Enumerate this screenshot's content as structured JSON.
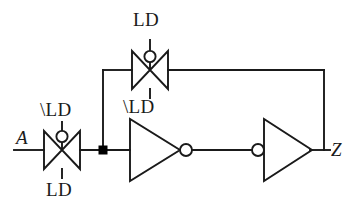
{
  "diagram": {
    "type": "schematic",
    "background_color": "#ffffff",
    "line_color": "#1a1a1a",
    "junction_color": "#000000",
    "ports": {
      "input": {
        "name": "A",
        "label": "A",
        "x": 22,
        "y": 137
      },
      "output": {
        "name": "Z",
        "label": "Z",
        "x": 331,
        "y": 158
      }
    },
    "components": [
      {
        "id": "tg-input",
        "kind": "transmission-gate",
        "name": "input-transmission-gate",
        "cx": 62,
        "cy": 150,
        "top_label": "\\LD",
        "bottom_label": "LD",
        "bubble_position": "top"
      },
      {
        "id": "tg-feedback",
        "kind": "transmission-gate",
        "name": "feedback-transmission-gate",
        "cx": 150,
        "cy": 70,
        "top_label": "LD",
        "bottom_label": "\\LD",
        "bubble_position": "top"
      },
      {
        "id": "inv-1",
        "kind": "inverter",
        "name": "first-inverter",
        "direction": "right",
        "bubble_side": "output",
        "x1": 130,
        "x2": 186,
        "cy": 150
      },
      {
        "id": "inv-2",
        "kind": "inverter",
        "name": "second-inverter",
        "direction": "right",
        "bubble_side": "input",
        "x1": 258,
        "x2": 310,
        "cy": 150
      }
    ],
    "labels": [
      {
        "id": "tg-input-top",
        "text": "\\LD",
        "x": 40,
        "y": 100,
        "style": "signal"
      },
      {
        "id": "tg-input-bottom",
        "text": "LD",
        "x": 46,
        "y": 180,
        "style": "signal"
      },
      {
        "id": "tg-feedback-top",
        "text": "LD",
        "x": 133,
        "y": 10,
        "style": "signal"
      },
      {
        "id": "tg-feedback-bottom",
        "text": "\\LD",
        "x": 123,
        "y": 97,
        "style": "signal"
      },
      {
        "id": "port-a",
        "text": "A",
        "x": 16,
        "y": 128,
        "style": "port"
      },
      {
        "id": "port-z",
        "text": "Z",
        "x": 331,
        "y": 140,
        "style": "port"
      }
    ],
    "nets": [
      {
        "id": "net-in",
        "name": "input-wire",
        "from": "A",
        "to": "tg-input"
      },
      {
        "id": "net-node",
        "name": "storage-node-wire",
        "from": "tg-input",
        "to": "inv-1"
      },
      {
        "id": "net-mid",
        "name": "inverter-link-wire",
        "from": "inv-1",
        "to": "inv-2"
      },
      {
        "id": "net-out",
        "name": "output-wire",
        "from": "inv-2",
        "to": "Z"
      },
      {
        "id": "net-fb-up",
        "name": "feedback-riser-wire",
        "from": "inv-2",
        "to": "tg-feedback"
      },
      {
        "id": "net-fb-down",
        "name": "feedback-return-wire",
        "from": "tg-feedback",
        "to": "storage-node"
      }
    ],
    "junctions": [
      {
        "id": "j1",
        "name": "storage-node-junction",
        "x": 103,
        "y": 150,
        "shape": "square",
        "size": 9
      }
    ]
  }
}
